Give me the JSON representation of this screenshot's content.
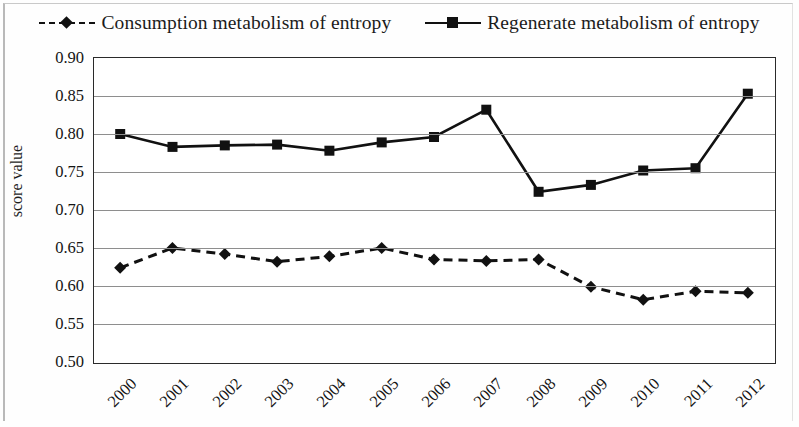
{
  "chart_data": {
    "type": "line",
    "title": "",
    "xlabel": "",
    "ylabel": "score value",
    "categories": [
      "2000",
      "2001",
      "2002",
      "2003",
      "2004",
      "2005",
      "2006",
      "2007",
      "2008",
      "2009",
      "2010",
      "2011",
      "2012"
    ],
    "ylim": [
      0.5,
      0.9
    ],
    "ytick_step": 0.05,
    "yticks": [
      "0.90",
      "0.85",
      "0.80",
      "0.75",
      "0.70",
      "0.65",
      "0.60",
      "0.55",
      "0.50"
    ],
    "grid": true,
    "legend_position": "top",
    "series": [
      {
        "name": "Consumption metabolism of entropy",
        "line_style": "dashed",
        "marker": "diamond",
        "color": "#111111",
        "values": [
          0.624,
          0.65,
          0.642,
          0.632,
          0.639,
          0.65,
          0.635,
          0.633,
          0.635,
          0.599,
          0.582,
          0.593,
          0.591
        ]
      },
      {
        "name": "Regenerate metabolism of entropy",
        "line_style": "solid",
        "marker": "square",
        "color": "#111111",
        "values": [
          0.8,
          0.783,
          0.785,
          0.786,
          0.778,
          0.789,
          0.796,
          0.832,
          0.724,
          0.733,
          0.752,
          0.755,
          0.853
        ]
      }
    ]
  },
  "legend": {
    "items": [
      {
        "label": "Consumption metabolism of entropy"
      },
      {
        "label": "Regenerate metabolism of entropy"
      }
    ]
  },
  "axis": {
    "y_title": "score value"
  }
}
